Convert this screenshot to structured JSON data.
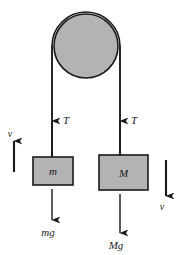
{
  "figure": {
    "type": "free-body-diagram",
    "background_color": "#ffffff",
    "stroke_color": "#1a1a1a",
    "fill_gray": "#b3b3b3"
  },
  "pulley": {
    "name": "pulley",
    "fill": "#b3b3b3",
    "outline": "#1a1a1a",
    "center_x": 86,
    "center_y": 46,
    "radius": 34
  },
  "strings": {
    "left_x": 52,
    "right_x": 120,
    "top_y": 46,
    "left_bottom_y": 158,
    "right_bottom_y": 155
  },
  "tension_left": {
    "label": "T",
    "label_x": 66,
    "label_y": 124,
    "arrow_x": 52,
    "arrow_tip_y": 120,
    "arrow_tail_y": 158
  },
  "tension_right": {
    "label": "T",
    "label_x": 134,
    "label_y": 124,
    "arrow_x": 120,
    "arrow_tip_y": 120,
    "arrow_tail_y": 155
  },
  "block_small": {
    "label": "m",
    "x": 33,
    "y": 157,
    "width": 40,
    "height": 28,
    "fill": "#b3b3b3",
    "outline": "#1a1a1a"
  },
  "block_large": {
    "label": "M",
    "x": 99,
    "y": 155,
    "width": 49,
    "height": 35,
    "fill": "#b3b3b3",
    "outline": "#1a1a1a"
  },
  "weight_left": {
    "label": "mg",
    "label_x": 42,
    "label_y": 234,
    "arrow_x": 52,
    "arrow_tail_y": 189,
    "arrow_tip_y": 221
  },
  "weight_right": {
    "label": "Mg",
    "label_x": 108,
    "label_y": 247,
    "arrow_x": 120,
    "arrow_tail_y": 194,
    "arrow_tip_y": 234
  },
  "velocity_left": {
    "label": "v",
    "direction": "up",
    "label_x": 9,
    "label_y": 135,
    "arrow_x": 14,
    "arrow_tip_y": 140,
    "arrow_tail_y": 172
  },
  "velocity_right": {
    "label": "v",
    "direction": "down",
    "label_x": 161,
    "label_y": 207,
    "arrow_x": 166,
    "arrow_tail_y": 160,
    "arrow_tip_y": 197
  }
}
